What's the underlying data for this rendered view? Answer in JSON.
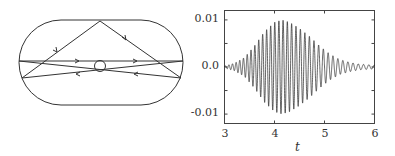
{
  "diagram": {
    "type": "stadium-billiard",
    "stroke_color": "#333333"
  },
  "chart_data": {
    "type": "line",
    "title": "",
    "xlabel": "t",
    "ylabel": "",
    "xlim": [
      3,
      6
    ],
    "ylim": [
      -0.012,
      0.012
    ],
    "x_ticks": [
      3,
      4,
      5,
      6
    ],
    "x_tick_labels": [
      "3",
      "4",
      "5",
      "6"
    ],
    "y_ticks": [
      -0.01,
      0.0,
      0.01
    ],
    "y_tick_labels": [
      "-0.01",
      "0.0",
      "0.01"
    ],
    "grid": false,
    "legend": null,
    "line_color": "#222222",
    "series": [
      {
        "name": "signal",
        "description": "Fast oscillation with Gaussian-like envelope; envelope grows from ~0 at t=3, peaks ~0.01 near t=4.15, decays to ~0.0005 by t=6",
        "envelope": {
          "t": [
            3.0,
            3.2,
            3.4,
            3.6,
            3.8,
            4.0,
            4.15,
            4.3,
            4.5,
            4.7,
            4.9,
            5.1,
            5.3,
            5.5,
            5.7,
            6.0
          ],
          "amplitude": [
            0.0002,
            0.0008,
            0.002,
            0.0045,
            0.0075,
            0.0095,
            0.01,
            0.0095,
            0.0082,
            0.0065,
            0.0045,
            0.0028,
            0.0016,
            0.001,
            0.0006,
            0.0004
          ]
        },
        "oscillation_period": 0.07
      }
    ]
  },
  "labels": {
    "y_top": "0.01",
    "y_mid": "0.0",
    "y_bottom": "-0.01",
    "x_3": "3",
    "x_4": "4",
    "x_5": "5",
    "x_6": "6",
    "x_title": "t"
  }
}
